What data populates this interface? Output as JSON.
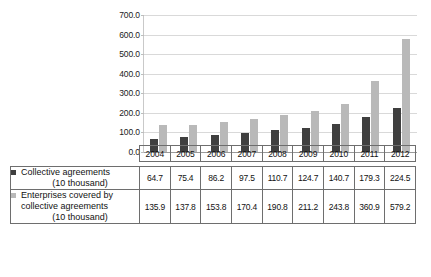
{
  "chart_data": {
    "type": "bar",
    "title": "",
    "subtitle": "",
    "xlabel": "",
    "ylabel": "",
    "categories": [
      "2004",
      "2005",
      "2006",
      "2007",
      "2008",
      "2009",
      "2010",
      "2011",
      "2012"
    ],
    "series": [
      {
        "name": "Collective agreements (10 thousand)",
        "color": "#3f3f3f",
        "values": [
          64.7,
          75.4,
          86.2,
          97.5,
          110.7,
          124.7,
          140.7,
          179.3,
          224.5
        ]
      },
      {
        "name": "Enterprises covered by collective agreements (10 thousand)",
        "color": "#b9b9b9",
        "values": [
          135.9,
          137.8,
          153.8,
          170.4,
          190.8,
          211.2,
          243.8,
          360.9,
          579.2
        ]
      }
    ],
    "ylim": [
      0,
      700
    ],
    "ytick_step": 100,
    "ytick_labels": [
      "0.0",
      "100.0",
      "200.0",
      "300.0",
      "400.0",
      "500.0",
      "600.0",
      "700.0"
    ],
    "grid": true,
    "legend_position": "table-row-labels"
  },
  "table": {
    "corner_label": "",
    "year_headers": [
      "2004",
      "2005",
      "2006",
      "2007",
      "2008",
      "2009",
      "2010",
      "2011",
      "2012"
    ],
    "rows": [
      {
        "label_line1": "Collective agreements",
        "label_line2": "(10 thousand)",
        "label_line3": "",
        "swatch_color": "#3f3f3f",
        "values": [
          "64.7",
          "75.4",
          "86.2",
          "97.5",
          "110.7",
          "124.7",
          "140.7",
          "179.3",
          "224.5"
        ]
      },
      {
        "label_line1": "Enterprises covered by",
        "label_line2": "collective agreements",
        "label_line3": "(10 thousand)",
        "swatch_color": "#b9b9b9",
        "values": [
          "135.9",
          "137.8",
          "153.8",
          "170.4",
          "190.8",
          "211.2",
          "243.8",
          "360.9",
          "579.2"
        ]
      }
    ]
  }
}
